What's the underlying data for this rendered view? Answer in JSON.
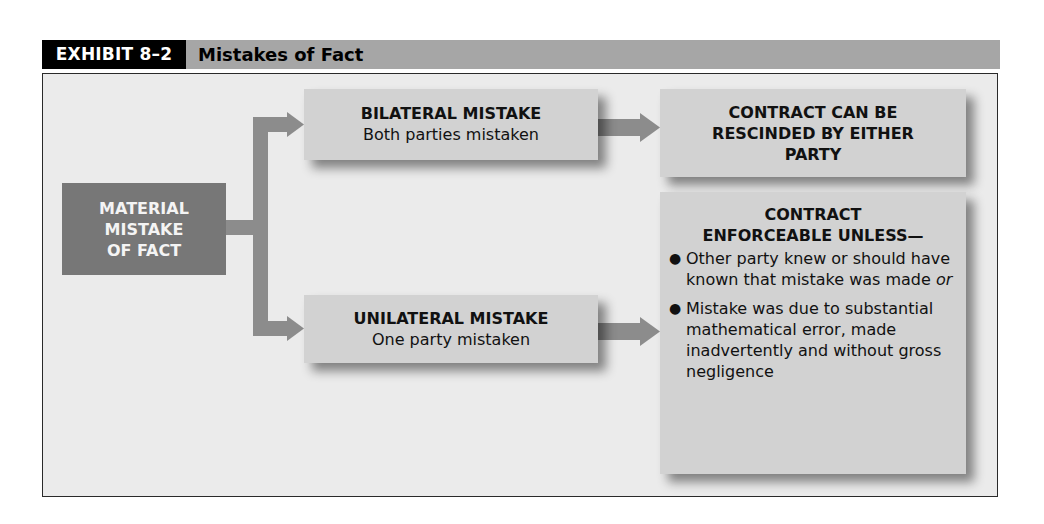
{
  "header": {
    "label": "EXHIBIT 8–2",
    "title": "Mistakes of Fact"
  },
  "colors": {
    "header_label_bg": "#000000",
    "header_bar_bg": "#a6a6a6",
    "frame_bg": "#ebebeb",
    "root_box_bg": "#777777",
    "box_bg": "#d2d2d2",
    "connector": "#8c8c8c"
  },
  "diagram": {
    "root": {
      "lines": [
        "MATERIAL",
        "MISTAKE",
        "OF FACT"
      ]
    },
    "bilateral": {
      "title": "BILATERAL MISTAKE",
      "subtitle": "Both parties mistaken"
    },
    "unilateral": {
      "title": "UNILATERAL MISTAKE",
      "subtitle": "One party mistaken"
    },
    "result_bilateral": {
      "lines": [
        "CONTRACT CAN BE",
        "RESCINDED BY EITHER",
        "PARTY"
      ]
    },
    "result_unilateral": {
      "title_lines": [
        "CONTRACT",
        "ENFORCEABLE UNLESS—"
      ],
      "bullets": [
        {
          "text": "Other party knew or should have known that mistake was made ",
          "emph": "or"
        },
        {
          "text": "Mistake was due to substantial mathematical error, made inadvertently and without gross negligence",
          "emph": ""
        }
      ],
      "bullet_glyph": "●"
    },
    "edges": [
      {
        "from": "root",
        "to": "bilateral"
      },
      {
        "from": "root",
        "to": "unilateral"
      },
      {
        "from": "bilateral",
        "to": "result_bilateral"
      },
      {
        "from": "unilateral",
        "to": "result_unilateral"
      }
    ]
  }
}
